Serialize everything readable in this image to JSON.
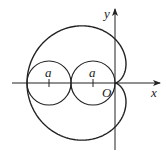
{
  "diagram": {
    "type": "cardioid",
    "equation": "r = 2a(1 - cos θ)",
    "labels": {
      "x_axis": "x",
      "y_axis": "y",
      "origin": "O",
      "circle_left_center": "a",
      "circle_right_center": "a"
    },
    "colors": {
      "stroke": "#222222",
      "background": "#ffffff"
    }
  }
}
